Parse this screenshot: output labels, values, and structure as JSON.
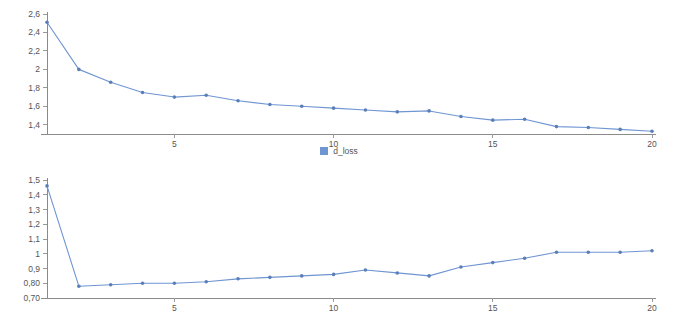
{
  "page": {
    "background": "#ffffff",
    "accent_color": "#6f95d2",
    "axis_color": "#8a8a8a",
    "label_color": "#555555"
  },
  "chart_data": [
    {
      "type": "line",
      "id": "d_loss",
      "title": "",
      "xlabel": "",
      "ylabel": "",
      "legend": "d_loss",
      "legend_position": "bottom-center",
      "grid": false,
      "series_color": "#6f95d2",
      "marker": "circle",
      "x": [
        1,
        2,
        3,
        4,
        5,
        6,
        7,
        8,
        9,
        10,
        11,
        12,
        13,
        14,
        15,
        16,
        17,
        18,
        19,
        20
      ],
      "values": [
        2.51,
        2.0,
        1.86,
        1.75,
        1.7,
        1.72,
        1.66,
        1.62,
        1.6,
        1.58,
        1.56,
        1.54,
        1.55,
        1.49,
        1.45,
        1.46,
        1.38,
        1.37,
        1.35,
        1.33
      ],
      "xlim": [
        1,
        20
      ],
      "ylim": [
        1.3,
        2.6
      ],
      "xticks": [
        5,
        10,
        15,
        20
      ],
      "xtick_labels": [
        "5",
        "10",
        "15",
        "20"
      ],
      "yticks": [
        1.4,
        1.6,
        1.8,
        2.0,
        2.2,
        2.4,
        2.6
      ],
      "ytick_labels": [
        "1,4",
        "1,6",
        "1,8",
        "2",
        "2,2",
        "2,4",
        "2,6"
      ]
    },
    {
      "type": "line",
      "id": "g_loss",
      "title": "",
      "xlabel": "",
      "ylabel": "",
      "legend": "g_loss",
      "legend_position": "bottom-center",
      "grid": false,
      "series_color": "#6f95d2",
      "marker": "circle",
      "x": [
        1,
        2,
        3,
        4,
        5,
        6,
        7,
        8,
        9,
        10,
        11,
        12,
        13,
        14,
        15,
        16,
        17,
        18,
        19,
        20
      ],
      "values": [
        1.46,
        0.78,
        0.79,
        0.8,
        0.8,
        0.81,
        0.83,
        0.84,
        0.85,
        0.86,
        0.89,
        0.87,
        0.85,
        0.91,
        0.94,
        0.97,
        1.01,
        1.01,
        1.01,
        1.02
      ],
      "xlim": [
        1,
        20
      ],
      "ylim": [
        0.7,
        1.5
      ],
      "xticks": [
        5,
        10,
        15,
        20
      ],
      "xtick_labels": [
        "5",
        "10",
        "15",
        "20"
      ],
      "yticks": [
        0.7,
        0.8,
        0.9,
        1.0,
        1.1,
        1.2,
        1.3,
        1.4,
        1.5
      ],
      "ytick_labels": [
        "0,70",
        "0,80",
        "0,9",
        "1",
        "1,1",
        "1,2",
        "1,3",
        "1,4",
        "1,5"
      ]
    }
  ]
}
